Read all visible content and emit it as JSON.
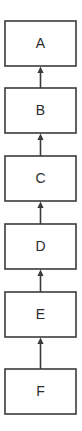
{
  "diagram": {
    "type": "flowchart",
    "title": "",
    "orientation": "vertical-bottom-to-top",
    "canvas": {
      "width": 82,
      "height": 431,
      "background": "#ffffff"
    },
    "style": {
      "node_fill": "#ffffff",
      "node_border": "#3b3b3b",
      "edge_color": "#3b3b3b",
      "label_color": "#2b2b2b"
    },
    "nodes": [
      {
        "id": "A",
        "label": "A",
        "x": 5,
        "y": 21,
        "width": 71,
        "height": 45
      },
      {
        "id": "B",
        "label": "B",
        "x": 5,
        "y": 88,
        "width": 71,
        "height": 45
      },
      {
        "id": "C",
        "label": "C",
        "x": 5,
        "y": 156,
        "width": 71,
        "height": 45
      },
      {
        "id": "D",
        "label": "D",
        "x": 5,
        "y": 224,
        "width": 71,
        "height": 45
      },
      {
        "id": "E",
        "label": "E",
        "x": 5,
        "y": 292,
        "width": 71,
        "height": 45
      },
      {
        "id": "F",
        "label": "F",
        "x": 5,
        "y": 369,
        "width": 71,
        "height": 45
      }
    ],
    "edges": [
      {
        "from": "B",
        "to": "A",
        "label": "",
        "arrow": "up",
        "x": 40.5,
        "y_tail": 88,
        "y_head": 66
      },
      {
        "from": "C",
        "to": "B",
        "label": "",
        "arrow": "up",
        "x": 40.5,
        "y_tail": 156,
        "y_head": 133
      },
      {
        "from": "D",
        "to": "C",
        "label": "",
        "arrow": "up",
        "x": 40.5,
        "y_tail": 224,
        "y_head": 201
      },
      {
        "from": "E",
        "to": "D",
        "label": "",
        "arrow": "up",
        "x": 40.5,
        "y_tail": 292,
        "y_head": 269
      },
      {
        "from": "F",
        "to": "E",
        "label": "",
        "arrow": "up",
        "x": 40.5,
        "y_tail": 369,
        "y_head": 337
      }
    ]
  }
}
